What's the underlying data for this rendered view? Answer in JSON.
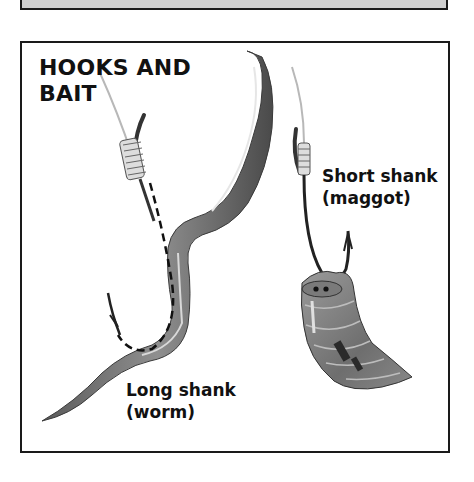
{
  "previous_panel": {
    "visible": "bottom edge only"
  },
  "panel": {
    "title_line1": "HOOKS AND",
    "title_line2": "BAIT",
    "labels": {
      "short_shank": "Short shank",
      "short_shank_bait": "(maggot)",
      "long_shank": "Long shank",
      "long_shank_bait": "(worm)"
    },
    "illustrations": [
      {
        "name": "long-shank-hook-with-worm",
        "bait": "worm"
      },
      {
        "name": "short-shank-hook-with-maggot",
        "bait": "maggot"
      }
    ],
    "colors": {
      "border": "#1a1a1a",
      "text": "#111111",
      "bait_dark": "#555555",
      "bait_mid": "#8a8a8a",
      "bait_light": "#cfcfcf"
    }
  }
}
